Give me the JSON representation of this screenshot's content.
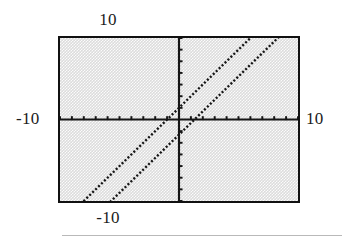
{
  "figure": {
    "name": "cartesian-plot",
    "background_color": "#dcdcdc",
    "frame_color": "#111111",
    "rule_color": "#b9b9b9"
  },
  "labels": {
    "top": "10",
    "left": "-10",
    "right": "10",
    "bottom": "-10"
  },
  "chart_data": {
    "type": "line",
    "title": "",
    "xlabel": "",
    "ylabel": "",
    "xlim": [
      -10,
      10
    ],
    "ylim": [
      -7,
      7
    ],
    "grid": false,
    "legend": null,
    "axis_style": "centered-cross",
    "tick_labels_x": [
      "-10",
      "10"
    ],
    "tick_labels_y": [
      "-10",
      "10"
    ],
    "x_tick_step": 1,
    "y_tick_step": 1,
    "line_style": "dotted",
    "line_color": "#161616",
    "series": [
      {
        "name": "line-1",
        "slope": 1,
        "intercept": 1,
        "x": [
          -10,
          10
        ],
        "y": [
          -9,
          11
        ]
      },
      {
        "name": "line-2",
        "slope": 1,
        "intercept": -1.3,
        "x": [
          -10,
          10
        ],
        "y": [
          -11.3,
          8.7
        ]
      }
    ]
  }
}
